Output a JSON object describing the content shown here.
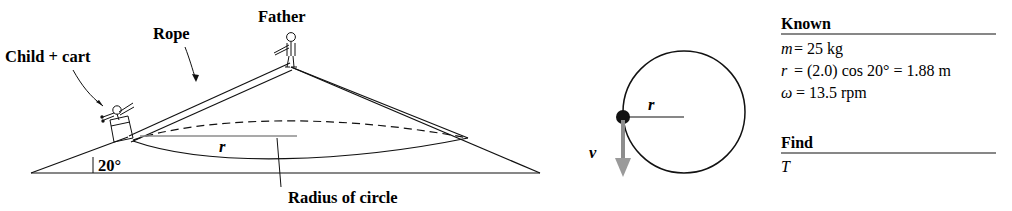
{
  "figure": {
    "panels": {
      "perspective": {
        "name": "perspective-cone-diagram",
        "labels": {
          "child_cart": "Child + cart",
          "rope": "Rope",
          "father": "Father",
          "angle": "20°",
          "radius_symbol": "r",
          "radius_caption": "Radius of circle"
        }
      },
      "topview": {
        "name": "top-view-circle-diagram",
        "labels": {
          "radius_symbol": "r",
          "velocity_symbol": "v⃗"
        }
      },
      "known": {
        "name": "known-find-panel",
        "known_heading": "Known",
        "known_items": [
          {
            "symbol": "m",
            "rest": " = 25 kg"
          },
          {
            "symbol": "r",
            "rest": " = (2.0) cos 20° = 1.88 m"
          },
          {
            "symbol": "ω",
            "rest": " = 13.5 rpm"
          }
        ],
        "find_heading": "Find",
        "find_items": [
          {
            "symbol": "T"
          }
        ]
      }
    },
    "colors": {
      "ink": "#111111",
      "gray_accent": "#8d8d8d",
      "background": "#ffffff"
    }
  }
}
